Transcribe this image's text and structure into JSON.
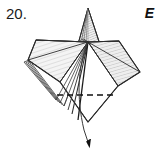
{
  "figure": {
    "step_number_label": "20.",
    "panel_letter_label": "E",
    "diagram_type": "origami-fold-step",
    "width": 162,
    "height": 157,
    "colors": {
      "background": "#ffffff",
      "outline": "#2b2b2b",
      "fill_light": "#f2f2f2",
      "fill_shade": "#e2e2e2",
      "hatch_line": "#b9b9b9",
      "crease_dashed": "#111111",
      "arrow": "#111111",
      "text": "#1a1a1a"
    },
    "geometry": {
      "apex_point": [
        88,
        8
      ],
      "center_point": [
        88,
        42
      ],
      "left_point": [
        28,
        60
      ],
      "right_point": [
        140,
        72
      ],
      "bottom_point": [
        88,
        122
      ],
      "top_left_corner": [
        92,
        41
      ],
      "top_right_corner": [
        117,
        41
      ],
      "left_mid": [
        60,
        82
      ],
      "right_mid": [
        118,
        85
      ]
    },
    "elements": [
      {
        "name": "top-spike-flap",
        "description": "narrow triangular spike rising above the body with fine layer lines"
      },
      {
        "name": "left-layered-flaps",
        "description": "four to five stacked offset flap edges on the left side"
      },
      {
        "name": "left-panel-shaded",
        "description": "large shaded quadrilateral panel on the left of the center point"
      },
      {
        "name": "right-panel-shaded",
        "description": "large shaded quadrilateral panel on the right of the center point"
      },
      {
        "name": "lower-diamond-white",
        "description": "white lower triangular region between center and bottom point"
      },
      {
        "name": "dashed-crease-line",
        "description": "horizontal valley-fold dashed line across the lower body",
        "from": [
          57,
          95
        ],
        "to": [
          115,
          95
        ],
        "dash_pattern": "6 4"
      },
      {
        "name": "fold-arrow",
        "description": "curved arrow sweeping from the center point down past the bottom edge to the lower right, solid filled head",
        "start": [
          88,
          42
        ],
        "end": [
          90,
          148
        ]
      }
    ]
  }
}
